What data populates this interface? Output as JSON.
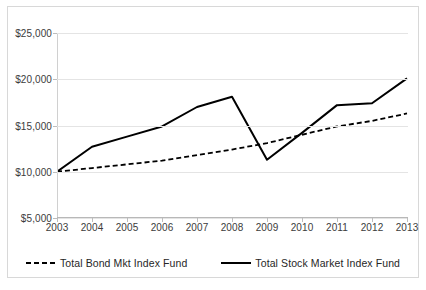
{
  "chart_data": {
    "type": "line",
    "title": "",
    "xlabel": "",
    "ylabel": "",
    "categories": [
      "2003",
      "2004",
      "2005",
      "2006",
      "2007",
      "2008",
      "2009",
      "2010",
      "2011",
      "2012",
      "2013"
    ],
    "ylim": [
      5000,
      25000
    ],
    "y_ticks": [
      5000,
      10000,
      15000,
      20000,
      25000
    ],
    "y_tick_labels": [
      "$5,000",
      "$10,000",
      "$15,000",
      "$20,000",
      "$25,000"
    ],
    "grid": true,
    "legend_position": "bottom",
    "series": [
      {
        "name": "Total Bond Mkt Index Fund",
        "style": "dashed",
        "color": "#000000",
        "values": [
          10000,
          10400,
          10800,
          11200,
          11800,
          12400,
          13100,
          14000,
          14900,
          15500,
          16300
        ]
      },
      {
        "name": "Total Stock Market Index Fund",
        "style": "solid",
        "color": "#000000",
        "values": [
          10000,
          12700,
          13800,
          14900,
          17000,
          18100,
          11300,
          14200,
          17200,
          17400,
          20100
        ]
      }
    ]
  },
  "legend": {
    "items": [
      {
        "label": "Total Bond Mkt Index Fund",
        "swatch": "dashed-line-swatch"
      },
      {
        "label": "Total Stock Market Index Fund",
        "swatch": "solid-line-swatch"
      }
    ]
  }
}
